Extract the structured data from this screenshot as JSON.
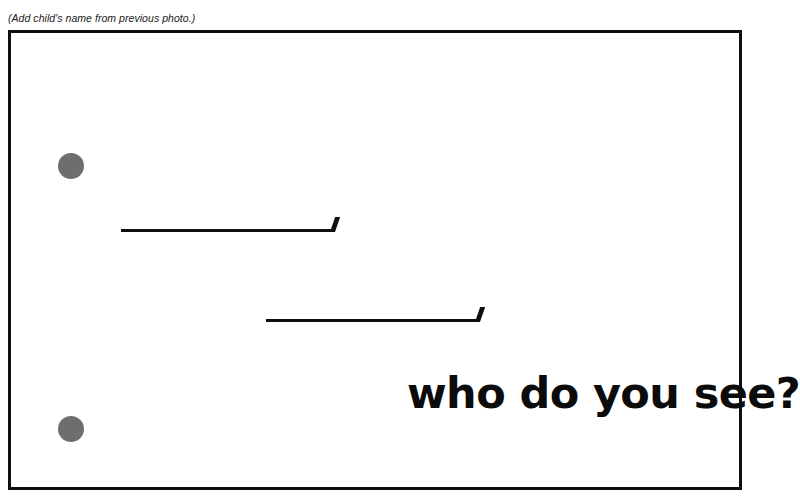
{
  "page": {
    "background_color": "#ffffff",
    "width": 775,
    "height": 503
  },
  "header": {
    "instruction_note": "(Add child's name from previous photo.)"
  },
  "card": {
    "border_color": "#0f0f0f",
    "background_color": "#ffffff",
    "dots": [
      {
        "name": "dot-top",
        "color": "#6e6e6e",
        "diameter": 26
      },
      {
        "name": "dot-bottom",
        "color": "#6e6e6e",
        "diameter": 26
      }
    ],
    "answer_lines": [
      {
        "name": "answer-line-1",
        "label": "",
        "length": 213,
        "color": "#0f0f0f"
      },
      {
        "name": "answer-line-2",
        "label": "",
        "length": 213,
        "color": "#0f0f0f"
      }
    ],
    "prompt_text": "who do you see?"
  }
}
